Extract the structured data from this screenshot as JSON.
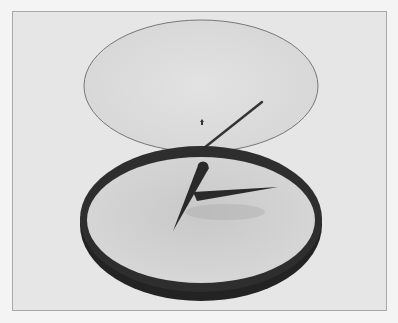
{
  "scene": {
    "subject": "clock with detached glass cover",
    "colors": {
      "page_background": "#f4f4f4",
      "frame_background": "#e6e6e6",
      "frame_border": "#a8a8a8",
      "glass_fill": "#dcdcdc",
      "glass_edge": "#777777",
      "rim": "#2b2b2b",
      "face": "#cfcfcf",
      "hands": "#2a2a2a"
    },
    "glass_cover": {
      "cx": 201,
      "cy": 86,
      "rx": 117,
      "ry": 66
    },
    "clock_rim": {
      "cx": 201,
      "cy": 222,
      "rx": 121,
      "ry": 78
    },
    "clock_face": {
      "cx": 201,
      "cy": 220,
      "rx": 114,
      "ry": 63
    },
    "second_hand": {
      "x1": 204,
      "y1": 147,
      "x2": 262,
      "y2": 102
    },
    "minute_hand": {
      "base_x": 203,
      "base_y": 170,
      "tip_x": 172,
      "tip_y": 231
    },
    "hour_hand": {
      "base_x": 196,
      "base_y": 196,
      "tip_x": 278,
      "tip_y": 187
    }
  }
}
